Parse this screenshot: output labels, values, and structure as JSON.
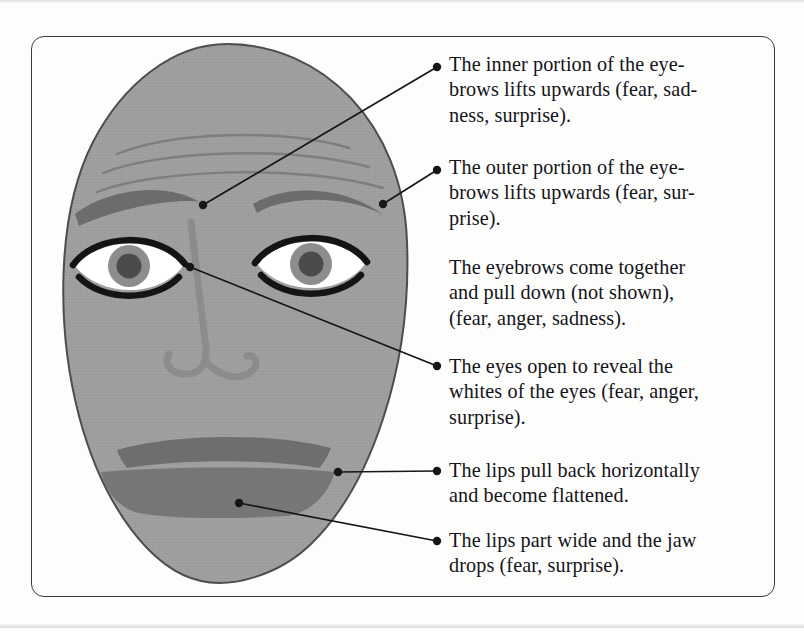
{
  "figure": {
    "type": "annotated-diagram",
    "frame_color": "#3a3a3a",
    "background_color": "#fdfdfc"
  },
  "face": {
    "label": "face-illustration",
    "skin_color": "#9e9e9e",
    "outline_color": "#4a4a4a",
    "brow_color": "#6e6e6e",
    "wrinkle_color": "#7b7b7b",
    "nose_color": "#8a8a8a",
    "lip_color": "#6e6e6e",
    "eye_outline_color": "#141414",
    "eye_white_color": "#ffffff",
    "iris_color": "#8d8d8d",
    "pupil_color": "#4d4d4d",
    "parts": [
      "forehead-wrinkles",
      "left-eyebrow",
      "right-eyebrow",
      "left-eye",
      "right-eye",
      "nose",
      "upper-lip",
      "lower-lip"
    ]
  },
  "callouts": [
    {
      "id": "inner-eyebrows",
      "bullet": true,
      "lines": [
        "The inner portion of the eye-",
        "brows lifts upwards (fear, sad-",
        "ness, surprise)."
      ],
      "text": "The inner portion of the eyebrows lifts upwards (fear, sadness, surprise).",
      "anchor": "inner-eyebrow-point"
    },
    {
      "id": "outer-eyebrows",
      "bullet": true,
      "lines": [
        "The outer portion of the eye-",
        "brows lifts upwards (fear, sur-",
        "prise)."
      ],
      "text": "The outer portion of the eyebrows lifts upwards (fear, surprise).",
      "anchor": "outer-eyebrow-point"
    },
    {
      "id": "eyebrows-together",
      "bullet": false,
      "lines": [
        "The eyebrows come together",
        "and pull down (not shown),",
        "(fear, anger, sadness)."
      ],
      "text": "The eyebrows come together and pull down (not shown), (fear, anger, sadness).",
      "anchor": null
    },
    {
      "id": "eyes-open",
      "bullet": true,
      "lines": [
        "The eyes open to reveal the",
        "whites of the eyes (fear, anger,",
        "surprise)."
      ],
      "text": "The eyes open to reveal the whites of the eyes (fear, anger, surprise).",
      "anchor": "eye-point"
    },
    {
      "id": "lips-pull-back",
      "bullet": true,
      "lines": [
        "The lips pull back horizontally",
        "and become flattened."
      ],
      "text": "The lips pull back horizontally and become flattened.",
      "anchor": "lip-corner-point"
    },
    {
      "id": "lips-part",
      "bullet": true,
      "lines": [
        "The lips part wide and the jaw",
        "drops (fear, surprise)."
      ],
      "text": "The lips part wide and the jaw drops (fear, surprise).",
      "anchor": "jaw-point"
    }
  ]
}
